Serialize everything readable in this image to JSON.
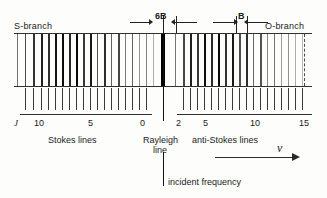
{
  "figure": {
    "branches": {
      "left_label": "S-branch",
      "right_label": "O-branch"
    },
    "dimensions": [
      {
        "label": "6B",
        "note": "gap between Rayleigh line and first Raman line"
      },
      {
        "label": "B",
        "note": "spacing between adjacent Raman lines"
      }
    ],
    "center": {
      "rayleigh_label_line1": "Rayleigh",
      "rayleigh_label_line2": "line",
      "incident_label": "incident frequency"
    },
    "captions": {
      "stokes": "Stokes lines",
      "anti_stokes": "anti-Stokes lines"
    },
    "axis": {
      "quantum_number_symbol": "J",
      "frequency_symbol": "ν",
      "left_ticks": [
        "10",
        "5",
        "0"
      ],
      "right_ticks": [
        "2",
        "5",
        "10",
        "15"
      ]
    },
    "colors": {
      "ink": "#1b1b1b",
      "rule": "#303030",
      "paper": "#fdfdfb"
    }
  },
  "chart_data": {
    "type": "line",
    "xlabel": "ν",
    "ylabel": "",
    "grid": false,
    "legend": "none",
    "annotations": [
      "S-branch",
      "O-branch",
      "6B",
      "B",
      "Stokes lines",
      "anti-Stokes lines",
      "Rayleigh line",
      "incident frequency"
    ],
    "axes": [
      {
        "name": "Stokes J axis",
        "side": "left",
        "labels": [
          "J",
          "10",
          "5",
          "0"
        ],
        "label_x_px": [
          16,
          38,
          90,
          142
        ]
      },
      {
        "name": "anti-Stokes J axis",
        "side": "right",
        "labels": [
          "2",
          "5",
          "10",
          "15"
        ],
        "label_x_px": [
          178,
          205,
          253,
          302
        ]
      }
    ],
    "rayleigh_line": {
      "x_px": 163,
      "intensity": 1.0,
      "width_px": 4.5
    },
    "spectral_lines": [
      {
        "x_px": 17,
        "w": 1.0,
        "shade": 0.55
      },
      {
        "x_px": 25,
        "w": 1.4,
        "shade": 0.7
      },
      {
        "x_px": 33,
        "w": 1.6,
        "shade": 0.8
      },
      {
        "x_px": 41,
        "w": 1.8,
        "shade": 0.88
      },
      {
        "x_px": 48,
        "w": 1.6,
        "shade": 0.82
      },
      {
        "x_px": 55,
        "w": 2.0,
        "shade": 0.92
      },
      {
        "x_px": 62,
        "w": 2.2,
        "shade": 0.95
      },
      {
        "x_px": 69,
        "w": 1.8,
        "shade": 0.85
      },
      {
        "x_px": 76,
        "w": 2.4,
        "shade": 0.97
      },
      {
        "x_px": 83,
        "w": 1.6,
        "shade": 0.78
      },
      {
        "x_px": 90,
        "w": 2.0,
        "shade": 0.9
      },
      {
        "x_px": 97,
        "w": 1.4,
        "shade": 0.68
      },
      {
        "x_px": 104,
        "w": 1.8,
        "shade": 0.82
      },
      {
        "x_px": 111,
        "w": 1.3,
        "shade": 0.62
      },
      {
        "x_px": 118,
        "w": 1.6,
        "shade": 0.72
      },
      {
        "x_px": 125,
        "w": 1.1,
        "shade": 0.52
      },
      {
        "x_px": 132,
        "w": 1.4,
        "shade": 0.62
      },
      {
        "x_px": 139,
        "w": 1.0,
        "shade": 0.42
      },
      {
        "x_px": 146,
        "w": 1.2,
        "shade": 0.5
      },
      {
        "x_px": 153,
        "w": 0.9,
        "shade": 0.32
      },
      {
        "x_px": 175,
        "w": 1.2,
        "shade": 0.55
      },
      {
        "x_px": 183,
        "w": 1.6,
        "shade": 0.72
      },
      {
        "x_px": 190,
        "w": 2.0,
        "shade": 0.88
      },
      {
        "x_px": 197,
        "w": 1.6,
        "shade": 0.78
      },
      {
        "x_px": 204,
        "w": 2.2,
        "shade": 0.94
      },
      {
        "x_px": 211,
        "w": 1.8,
        "shade": 0.84
      },
      {
        "x_px": 218,
        "w": 2.4,
        "shade": 0.97
      },
      {
        "x_px": 225,
        "w": 1.7,
        "shade": 0.8
      },
      {
        "x_px": 232,
        "w": 2.0,
        "shade": 0.9
      },
      {
        "x_px": 239,
        "w": 1.5,
        "shade": 0.7
      },
      {
        "x_px": 246,
        "w": 1.8,
        "shade": 0.82
      },
      {
        "x_px": 253,
        "w": 1.3,
        "shade": 0.6
      },
      {
        "x_px": 260,
        "w": 1.5,
        "shade": 0.68
      },
      {
        "x_px": 267,
        "w": 1.1,
        "shade": 0.48
      },
      {
        "x_px": 274,
        "w": 1.3,
        "shade": 0.55
      },
      {
        "x_px": 281,
        "w": 1.0,
        "shade": 0.4
      },
      {
        "x_px": 288,
        "w": 1.1,
        "shade": 0.44
      },
      {
        "x_px": 295,
        "w": 0.9,
        "shade": 0.32
      },
      {
        "x_px": 302,
        "w": 0.9,
        "shade": 0.28
      }
    ],
    "axis_ticks_px": [
      25,
      33,
      41,
      48,
      55,
      62,
      69,
      76,
      83,
      90,
      97,
      104,
      111,
      118,
      125,
      132,
      139,
      146,
      183,
      190,
      197,
      204,
      211,
      218,
      225,
      232,
      239,
      246,
      253,
      260,
      267,
      274,
      281,
      288,
      295,
      302
    ],
    "dashed_edge_px": 304
  }
}
